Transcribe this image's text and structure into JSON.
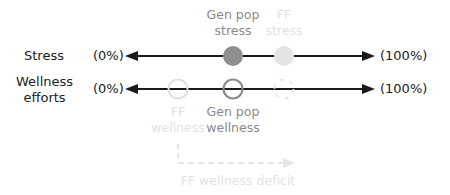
{
  "rows": [
    {
      "label": "Stress",
      "left_bound": "(0%)",
      "right_bound": "(100%)"
    },
    {
      "label_line1": "Wellness",
      "label_line2": "efforts",
      "left_bound": "(0%)",
      "right_bound": "(100%)"
    }
  ],
  "markers": {
    "gen_pop_stress": {
      "line1": "Gen pop",
      "line2": "stress",
      "style": "filled-dark",
      "color": "#8f8f8f"
    },
    "ff_stress": {
      "line1": "FF",
      "line2": "stress",
      "style": "filled-light",
      "color": "#e4e4e4"
    },
    "ff_wellness": {
      "line1": "FF",
      "line2": "wellness",
      "style": "open-light",
      "color": "#e0e0e0"
    },
    "gen_pop_wellness": {
      "line1": "Gen pop",
      "line2": "wellness",
      "style": "open-dark",
      "color": "#8a8a8a"
    },
    "ff_wellness_projected": {
      "style": "dashed-open",
      "color": "#e6e6e6"
    }
  },
  "deficit": {
    "label": "FF wellness deficit",
    "color": "#e6e6e6"
  },
  "colors": {
    "axis": "#1a1a1a",
    "text_dark": "#222222",
    "text_mid": "#8a8a8a",
    "text_faint": "#e2e2e2"
  }
}
